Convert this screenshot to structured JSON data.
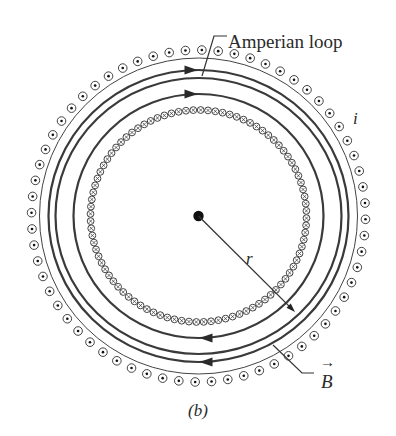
{
  "figure": {
    "caption": "(b)",
    "center": {
      "x": 198.5,
      "y": 216
    },
    "labels": {
      "amperian_loop": "Amperian loop",
      "current": "i",
      "radius": "r",
      "field": "B",
      "field_vector_arrow": "→"
    },
    "outer_winding": {
      "description": "current out of page (dot symbols)",
      "symbol": "dot",
      "count": 64,
      "rx": 167,
      "ry": 166,
      "symbol_radius": 4.3
    },
    "thin_boundary_ring": {
      "rx": 159,
      "ry": 158
    },
    "field_lines": [
      {
        "name": "outer-field-line",
        "rx": 150,
        "ry": 146,
        "arrows": true,
        "direction": "clockwise"
      },
      {
        "name": "amperian-loop",
        "rx": 143,
        "ry": 138,
        "arrows": false,
        "direction": "clockwise"
      },
      {
        "name": "inner-field-line",
        "rx": 125,
        "ry": 122,
        "arrows": true,
        "direction": "clockwise"
      }
    ],
    "inner_winding": {
      "description": "current into page (cross symbols)",
      "symbol": "cross",
      "count": 92,
      "rx": 108,
      "ry": 106,
      "symbol_radius": 3.4
    },
    "radius_arrow": {
      "from": {
        "x": 198.5,
        "y": 216
      },
      "to": {
        "x": 295,
        "y": 312
      }
    },
    "colors": {
      "ink": "#2f2f2f",
      "background": "#ffffff"
    }
  }
}
